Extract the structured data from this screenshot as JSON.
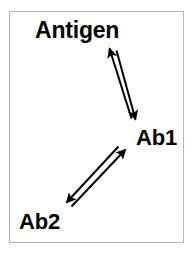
{
  "figure": {
    "title_text": "",
    "background_color": "#ffffff",
    "frame_color": "#b6b6b6",
    "stroke_color": "#000000"
  },
  "nodes": [
    {
      "id": "antigen",
      "label": "Antigen"
    },
    {
      "id": "ab1",
      "label": "Ab1"
    },
    {
      "id": "ab2",
      "label": "Ab2"
    }
  ],
  "edges": [
    {
      "id": "antigen-ab1",
      "from": "Ab1",
      "to": "Antigen",
      "direction": "bidirectional",
      "arrow_up_label": "",
      "arrow_down_label": ""
    },
    {
      "id": "ab2-ab1",
      "from": "Ab2",
      "to": "Ab1",
      "direction": "bidirectional",
      "arrow_up_label": "",
      "arrow_down_label": ""
    }
  ]
}
